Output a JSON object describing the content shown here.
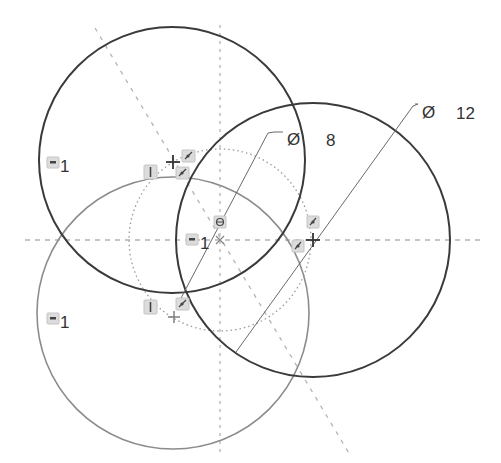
{
  "sketch": {
    "colors": {
      "primary_circle": "#3a3a3a",
      "secondary_circle": "#8c8c8c",
      "construction": "#b4b4b4",
      "dimension_line": "#6a6a6a",
      "text": "#333333",
      "glyph_bg": "#dcdcdc"
    },
    "dimensions": [
      {
        "id": "dia-small",
        "symbol": "Ø",
        "value": "8"
      },
      {
        "id": "dia-large",
        "symbol": "Ø",
        "value": "12"
      }
    ],
    "equal_constraints": [
      {
        "id": "eq-top",
        "label": "1"
      },
      {
        "id": "eq-center",
        "label": "1"
      },
      {
        "id": "eq-bottom",
        "label": "1"
      }
    ],
    "constraint_icons": [
      {
        "type": "vertical",
        "icon": "vertical-constraint-icon"
      },
      {
        "type": "tangent",
        "icon": "tangent-constraint-icon"
      },
      {
        "type": "coincident",
        "icon": "coincident-constraint-icon"
      }
    ]
  }
}
